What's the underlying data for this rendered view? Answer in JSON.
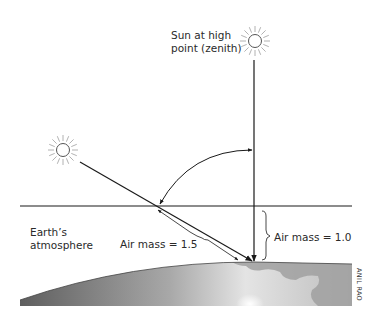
{
  "diagram": {
    "labels": {
      "zenith_sun_line1": "Sun at high",
      "zenith_sun_line2": "point (zenith)",
      "atmosphere_line1": "Earth’s",
      "atmosphere_line2": "atmosphere",
      "air_mass_slant": "Air mass = 1.5",
      "air_mass_vertical": "Air mass = 1.0",
      "credit": "ANIL RAO"
    },
    "icons": {
      "zenith_sun": "sun-icon",
      "low_sun": "sun-icon"
    },
    "colors": {
      "line": "#1a1a1a",
      "sun_ray": "#9a9a9a",
      "earth_dark": "#5a5a5a",
      "earth_light": "#d8d8d8",
      "land": "#9e9e9e"
    }
  }
}
